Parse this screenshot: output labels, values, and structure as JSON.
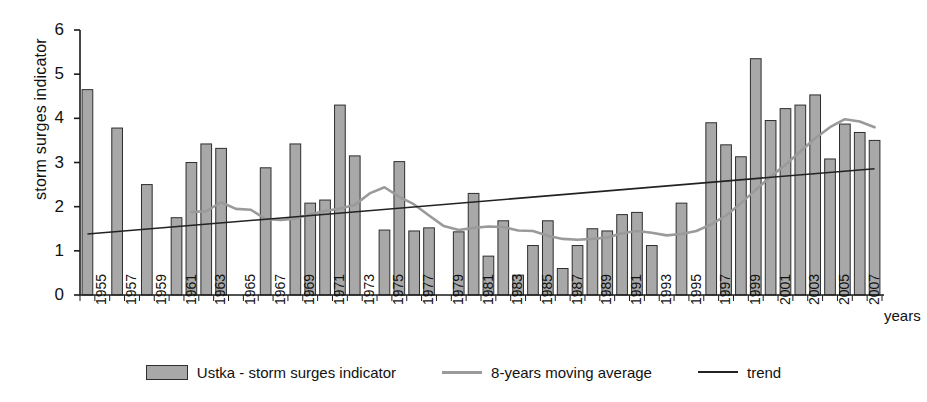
{
  "chart_data": {
    "type": "bar",
    "title": "",
    "xlabel": "years",
    "ylabel": "storm surges indicator",
    "ylim": [
      0,
      6
    ],
    "yticks": [
      0,
      1,
      2,
      3,
      4,
      5,
      6
    ],
    "xlim": [
      1954.5,
      2008.5
    ],
    "grid": false,
    "legend_position": "bottom",
    "categories": [
      1955,
      1956,
      1957,
      1958,
      1959,
      1960,
      1961,
      1962,
      1963,
      1964,
      1965,
      1966,
      1967,
      1968,
      1969,
      1970,
      1971,
      1972,
      1973,
      1974,
      1975,
      1976,
      1977,
      1978,
      1979,
      1980,
      1981,
      1982,
      1983,
      1984,
      1985,
      1986,
      1987,
      1988,
      1989,
      1990,
      1991,
      1992,
      1993,
      1994,
      1995,
      1996,
      1997,
      1998,
      1999,
      2000,
      2001,
      2002,
      2003,
      2004,
      2005,
      2006,
      2007,
      2008
    ],
    "xtick_labels": [
      "1955",
      "1957",
      "1959",
      "1961",
      "1963",
      "1965",
      "1967",
      "1969",
      "1971",
      "1973",
      "1975",
      "1977",
      "1979",
      "1981",
      "1983",
      "1985",
      "1987",
      "1989",
      "1991",
      "1993",
      "1995",
      "1997",
      "1999",
      "2001",
      "2003",
      "2005",
      "2007"
    ],
    "series": [
      {
        "name": "Ustka - storm surges indicator",
        "type": "bar",
        "color": "#a8a8a8",
        "edge_color": "#2e2e2e",
        "values": [
          4.65,
          0,
          3.78,
          0,
          2.5,
          0,
          1.75,
          3.0,
          3.42,
          3.32,
          0,
          0,
          2.88,
          0,
          3.42,
          2.08,
          2.15,
          4.3,
          3.15,
          0,
          1.47,
          3.02,
          1.45,
          1.52,
          0,
          1.43,
          2.3,
          0.88,
          1.68,
          0.45,
          1.12,
          1.68,
          0.6,
          1.12,
          1.5,
          1.45,
          1.82,
          1.87,
          1.12,
          0,
          2.08,
          0,
          3.9,
          3.4,
          3.13,
          5.35,
          3.95,
          4.22,
          4.3,
          4.53,
          3.08,
          3.87,
          3.68,
          3.5
        ]
      },
      {
        "name": "8-years moving average",
        "type": "line",
        "color": "#9a9a9a",
        "x": [
          1962,
          1963,
          1964,
          1965,
          1966,
          1967,
          1968,
          1969,
          1970,
          1971,
          1972,
          1973,
          1974,
          1975,
          1976,
          1977,
          1978,
          1979,
          1980,
          1981,
          1982,
          1983,
          1984,
          1985,
          1986,
          1987,
          1988,
          1989,
          1990,
          1991,
          1992,
          1993,
          1994,
          1995,
          1996,
          1997,
          1998,
          1999,
          2000,
          2001,
          2002,
          2003,
          2004,
          2005,
          2006,
          2007,
          2008
        ],
        "values": [
          1.88,
          1.9,
          2.1,
          1.95,
          1.93,
          1.72,
          1.7,
          1.73,
          1.83,
          1.9,
          1.96,
          2.04,
          2.3,
          2.44,
          2.22,
          2.05,
          1.8,
          1.56,
          1.47,
          1.52,
          1.55,
          1.54,
          1.46,
          1.45,
          1.34,
          1.27,
          1.25,
          1.27,
          1.3,
          1.4,
          1.45,
          1.41,
          1.35,
          1.38,
          1.45,
          1.6,
          1.8,
          2.08,
          2.38,
          2.68,
          2.95,
          3.25,
          3.55,
          3.8,
          3.98,
          3.93,
          3.8
        ]
      },
      {
        "name": "trend",
        "type": "line",
        "color": "#222222",
        "x": [
          1955,
          2008
        ],
        "values": [
          1.38,
          2.86
        ]
      }
    ]
  },
  "legend": {
    "items": [
      {
        "label": "Ustka - storm surges indicator",
        "marker": "bar-swatch"
      },
      {
        "label": "8-years moving average",
        "marker": "line-swatch-gray"
      },
      {
        "label": "trend",
        "marker": "line-swatch-black"
      }
    ]
  },
  "axis": {
    "y_title": "storm surges indicator",
    "x_title": "years"
  },
  "colors": {
    "bar_fill": "#a8a8a8",
    "bar_edge": "#2e2e2e",
    "moving_average": "#9a9a9a",
    "trend": "#222222",
    "axis": "#1a1a1a",
    "background": "#ffffff"
  }
}
